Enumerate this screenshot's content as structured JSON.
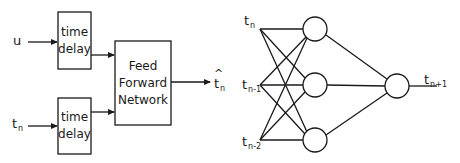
{
  "left_diagram": {
    "inputs": [
      {
        "base": "u",
        "sub": ""
      },
      {
        "base": "t",
        "sub": "n"
      }
    ],
    "delay_blocks": [
      {
        "line1": "time",
        "line2": "delay"
      },
      {
        "line1": "time",
        "line2": "delay"
      }
    ],
    "network_block": {
      "line1": "Feed",
      "line2": "Forward",
      "line3": "Network"
    },
    "output": {
      "base": "t",
      "sub": "n",
      "accent": "hat"
    }
  },
  "right_diagram": {
    "inputs": [
      {
        "base": "t",
        "sub": "n"
      },
      {
        "base": "t",
        "sub": "n-1"
      },
      {
        "base": "t",
        "sub": "n-2"
      }
    ],
    "hidden_neurons": 3,
    "output_neurons": 1,
    "output": {
      "base": "t",
      "sub": "n+1"
    }
  },
  "colors": {
    "stroke": "#1a1a1a",
    "background": "#ffffff"
  }
}
